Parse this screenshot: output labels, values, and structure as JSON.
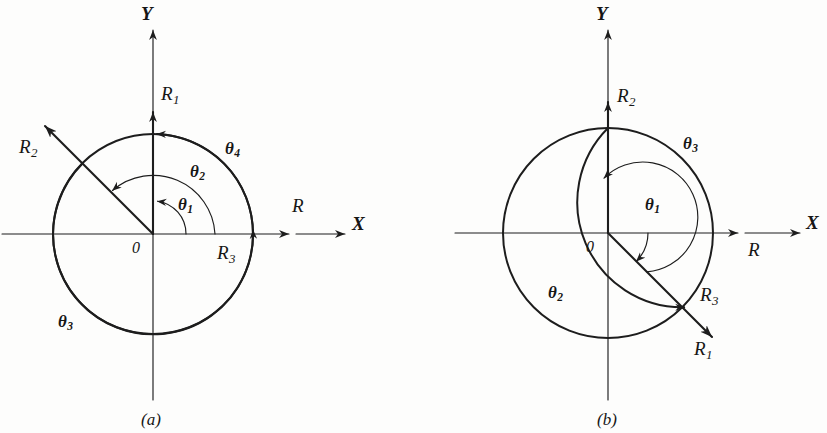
{
  "figure": {
    "background_color": "#fdfdfc",
    "ink_color": "#1d1d1d",
    "panels": [
      {
        "caption": "(a)",
        "origin_label": "0",
        "axis_x_label": "X",
        "axis_y_label": "Y",
        "resultant_label": "R",
        "vectors": [
          {
            "name": "R1",
            "base": "R",
            "subscript": "1",
            "angle_deg": 90,
            "label": "R₁"
          },
          {
            "name": "R2",
            "base": "R",
            "subscript": "2",
            "angle_deg": 135,
            "label": "R₂"
          },
          {
            "name": "R3",
            "base": "R",
            "subscript": "3",
            "angle_deg": 0,
            "label": "R₃"
          }
        ],
        "angles": [
          {
            "name": "theta1",
            "base": "θ",
            "subscript": "1",
            "sweep_deg": 90,
            "label": "θ₁"
          },
          {
            "name": "theta2",
            "base": "θ",
            "subscript": "2",
            "sweep_deg": 135,
            "label": "θ₂"
          },
          {
            "name": "theta3",
            "base": "θ",
            "subscript": "3",
            "sweep_deg": 225,
            "label": "θ₃"
          },
          {
            "name": "theta4",
            "base": "θ",
            "subscript": "4",
            "sweep_deg": 90,
            "label": "θ₄"
          }
        ]
      },
      {
        "caption": "(b)",
        "origin_label": "0",
        "axis_x_label": "X",
        "axis_y_label": "Y",
        "resultant_label": "R",
        "vectors": [
          {
            "name": "R1",
            "base": "R",
            "subscript": "1",
            "angle_deg": -45,
            "label": "R₁"
          },
          {
            "name": "R2",
            "base": "R",
            "subscript": "2",
            "angle_deg": 90,
            "label": "R₂"
          },
          {
            "name": "R3",
            "base": "R",
            "subscript": "3",
            "angle_deg": -45,
            "label": "R₃"
          }
        ],
        "angles": [
          {
            "name": "theta1",
            "base": "θ",
            "subscript": "1",
            "sweep_deg": -45,
            "label": "θ₁"
          },
          {
            "name": "theta2",
            "base": "θ",
            "subscript": "2",
            "sweep_deg": 315,
            "label": "θ₂"
          },
          {
            "name": "theta3",
            "base": "θ",
            "subscript": "3",
            "sweep_deg": 135,
            "label": "θ₃"
          }
        ]
      }
    ]
  },
  "labels": {
    "a": {
      "axis_y": "Y",
      "axis_x": "X",
      "origin": "0",
      "resultant": "R",
      "r1_base": "R",
      "r1_sub": "1",
      "r2_base": "R",
      "r2_sub": "2",
      "r3_base": "R",
      "r3_sub": "3",
      "t1_base": "θ",
      "t1_sub": "1",
      "t2_base": "θ",
      "t2_sub": "2",
      "t3_base": "θ",
      "t3_sub": "3",
      "t4_base": "θ",
      "t4_sub": "4",
      "caption": "(a)"
    },
    "b": {
      "axis_y": "Y",
      "axis_x": "X",
      "origin": "0",
      "resultant": "R",
      "r1_base": "R",
      "r1_sub": "1",
      "r2_base": "R",
      "r2_sub": "2",
      "r3_base": "R",
      "r3_sub": "3",
      "t1_base": "θ",
      "t1_sub": "1",
      "t2_base": "θ",
      "t2_sub": "2",
      "t3_base": "θ",
      "t3_sub": "3",
      "caption": "(b)"
    }
  }
}
